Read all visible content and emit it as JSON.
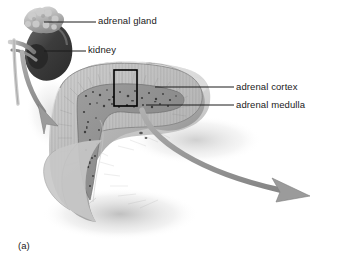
{
  "figure": {
    "panel_letter": "(a)",
    "background_color": "#ffffff",
    "labels": [
      {
        "id": "adrenal-gland",
        "text": "adrenal gland",
        "x": 98,
        "y": 16
      },
      {
        "id": "kidney",
        "text": "kidney",
        "x": 88,
        "y": 45
      },
      {
        "id": "adrenal-cortex",
        "text": "adrenal cortex",
        "x": 236,
        "y": 82
      },
      {
        "id": "adrenal-medulla",
        "text": "adrenal medulla",
        "x": 236,
        "y": 100
      }
    ],
    "leader_lines": [
      {
        "id": "leader-adrenal-gland",
        "from": [
          44,
          22
        ],
        "to": [
          96,
          22
        ]
      },
      {
        "id": "leader-kidney",
        "from": [
          44,
          51
        ],
        "to": [
          86,
          51
        ]
      },
      {
        "id": "leader-adrenal-cortex",
        "from": [
          155,
          87
        ],
        "to": [
          234,
          87
        ]
      },
      {
        "id": "leader-adrenal-medulla",
        "from": [
          146,
          105
        ],
        "to": [
          234,
          105
        ]
      }
    ],
    "highlight_box": {
      "x": 114,
      "y": 70,
      "width": 23,
      "height": 36,
      "color": "#000000"
    },
    "arrows": [
      {
        "id": "kidney-arrow",
        "description": "gray curved arrow from kidney hilum sweeping down-right",
        "tip": [
          56,
          126
        ]
      },
      {
        "id": "gland-arrow",
        "description": "large gray curved arrow sweeping from gland down-right off panel",
        "tip": [
          308,
          196
        ]
      }
    ],
    "structures": [
      {
        "id": "kidney",
        "tone": "#4a4a4a",
        "description": "dark bean-shaped kidney, upper left"
      },
      {
        "id": "adrenal-gland",
        "tone": "#b9b9b9",
        "description": "bumpy pale cap atop the kidney"
      },
      {
        "id": "adrenal-cortex",
        "tone": "#bdbdbd",
        "description": "outer striated band of the sectioned gland"
      },
      {
        "id": "adrenal-medulla",
        "tone": "#8e8e8e",
        "description": "inner speckled V-shaped core"
      },
      {
        "id": "cut-surface",
        "tone": "#a8a8a8",
        "description": "triangular cut face of the gland"
      }
    ],
    "colors": {
      "line": "#1a1a1a",
      "arrow": "#9a9a9a",
      "arrow_edge": "#7d7d7d",
      "shadow": "#cfcfcf"
    }
  }
}
